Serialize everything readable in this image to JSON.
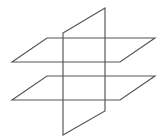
{
  "figure": {
    "canvas": {
      "width": 164,
      "height": 136
    },
    "style": {
      "background_color": "#ffffff",
      "line_color": "#555555",
      "line_width": 1.15
    },
    "planes": [
      {
        "id": "upper-horizontal-plane",
        "name": "Upper horizontal plane",
        "orientation": "horizontal",
        "shape": "parallelogram",
        "points": "12,62 47,38 155,38 120,62",
        "closed": true
      },
      {
        "id": "lower-horizontal-plane",
        "name": "Lower horizontal plane",
        "orientation": "horizontal",
        "shape": "parallelogram",
        "points": "12,100 47,76 155,76 120,100",
        "closed": true
      },
      {
        "id": "vertical-plane",
        "name": "Vertical plane",
        "orientation": "vertical",
        "shape": "parallelogram",
        "points": "63,33 105,8 105,111 63,135",
        "closed": true
      }
    ],
    "vertices": [
      {
        "id": "upper-plane-left",
        "x": 12,
        "y": 62
      },
      {
        "id": "upper-plane-back-left",
        "x": 47,
        "y": 38
      },
      {
        "id": "upper-plane-back-right",
        "x": 155,
        "y": 38
      },
      {
        "id": "upper-plane-right",
        "x": 120,
        "y": 62
      },
      {
        "id": "lower-plane-left",
        "x": 12,
        "y": 100
      },
      {
        "id": "lower-plane-back-left",
        "x": 47,
        "y": 76
      },
      {
        "id": "lower-plane-back-right",
        "x": 155,
        "y": 76
      },
      {
        "id": "lower-plane-right",
        "x": 120,
        "y": 100
      },
      {
        "id": "vertical-plane-top-left",
        "x": 63,
        "y": 33
      },
      {
        "id": "vertical-plane-top-right",
        "x": 105,
        "y": 8
      },
      {
        "id": "vertical-plane-bottom-right",
        "x": 105,
        "y": 111
      },
      {
        "id": "vertical-plane-bottom-left",
        "x": 63,
        "y": 135
      }
    ]
  }
}
